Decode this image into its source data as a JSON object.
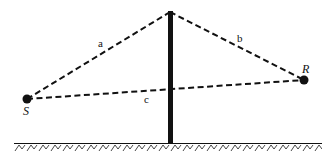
{
  "diagram": {
    "points": {
      "source": {
        "label": "S",
        "x": 27,
        "y": 99
      },
      "receiver": {
        "label": "R",
        "x": 304,
        "y": 80
      },
      "barrier_top": {
        "x": 170,
        "y": 12
      },
      "barrier_bottom": {
        "x": 170,
        "y": 143
      }
    },
    "paths": [
      {
        "label": "a",
        "from": "source",
        "to": "barrier_top",
        "style": "dashed"
      },
      {
        "label": "b",
        "from": "barrier_top",
        "to": "receiver",
        "style": "dashed"
      },
      {
        "label": "c",
        "from": "source",
        "to": "receiver",
        "style": "dashed"
      }
    ],
    "ground": {
      "y": 143,
      "x_start": 14,
      "x_end": 322,
      "hatched": true
    },
    "colors": {
      "line": "#111111",
      "background": "#ffffff"
    }
  },
  "labels": {
    "a": "a",
    "b": "b",
    "c": "c",
    "S": "S",
    "R": "R"
  }
}
